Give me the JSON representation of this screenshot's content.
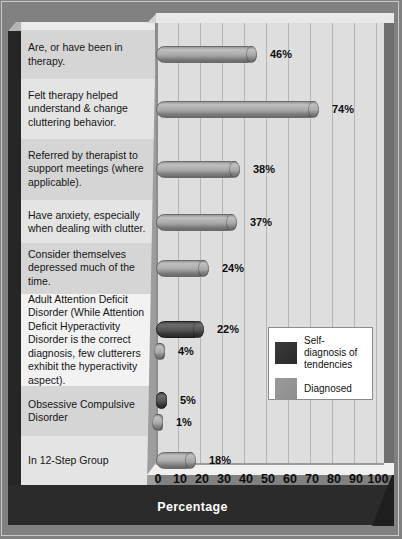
{
  "chart_data": {
    "type": "bar",
    "orientation": "horizontal",
    "title": "",
    "xlabel": "Percentage",
    "ylabel": "",
    "xlim": [
      0,
      100
    ],
    "xticks": [
      0,
      10,
      20,
      30,
      40,
      50,
      60,
      70,
      80,
      90,
      100
    ],
    "xtick_labels": [
      "0",
      "10",
      "20",
      "30",
      "40",
      "50",
      "60",
      "70",
      "80",
      "90",
      "100"
    ],
    "grid": "vertical",
    "legend_position": "center-right",
    "legend": [
      {
        "name": "Self-diagnosis of tendencies",
        "color": "#3b3b3b"
      },
      {
        "name": "Diagnosed",
        "color": "#8e8e8e"
      }
    ],
    "categories": [
      "Are, or have been in therapy.",
      "Felt therapy helped understand & change cluttering behavior.",
      "Referred by therapist to support meetings (where applicable).",
      "Have anxiety, especially when dealing with clutter.",
      "Consider themselves depressed much of the time.",
      "Adult Attention Deficit Disorder (While Attention Deficit Hyperactivity Disorder is the correct diagnosis, few clutterers exhibit the hyperactivity aspect).",
      "Obsessive Compulsive Disorder",
      "In 12-Step Group"
    ],
    "bars": [
      {
        "category_index": 0,
        "series": "Diagnosed",
        "value": 46,
        "label": "46%"
      },
      {
        "category_index": 1,
        "series": "Diagnosed",
        "value": 74,
        "label": "74%"
      },
      {
        "category_index": 2,
        "series": "Diagnosed",
        "value": 38,
        "label": "38%"
      },
      {
        "category_index": 3,
        "series": "Diagnosed",
        "value": 37,
        "label": "37%"
      },
      {
        "category_index": 4,
        "series": "Diagnosed",
        "value": 24,
        "label": "24%"
      },
      {
        "category_index": 5,
        "series": "Self-diagnosis of tendencies",
        "value": 22,
        "label": "22%"
      },
      {
        "category_index": 5,
        "series": "Diagnosed",
        "value": 4,
        "label": "4%"
      },
      {
        "category_index": 6,
        "series": "Self-diagnosis of tendencies",
        "value": 5,
        "label": "5%"
      },
      {
        "category_index": 6,
        "series": "Diagnosed",
        "value": 1,
        "label": "1%"
      },
      {
        "category_index": 7,
        "series": "Diagnosed",
        "value": 18,
        "label": "18%"
      }
    ]
  },
  "labels": {
    "row0": "Are, or have been in therapy.",
    "row1": "Felt therapy helped understand & change cluttering behavior.",
    "row2": "Referred by therapist to support meetings (where applicable).",
    "row3": "Have anxiety, especially when dealing with clutter.",
    "row4": "Consider themselves depressed much of the time.",
    "row5": "Adult Attention Deficit Disorder (While Attention Deficit Hyperactivity Disorder is the correct diagnosis, few clutterers exhibit the hyperactivity aspect).",
    "row6": "Obsessive Compulsive Disorder",
    "row7": "In 12-Step Group"
  },
  "values": {
    "v46": "46%",
    "v74": "74%",
    "v38": "38%",
    "v37": "37%",
    "v24": "24%",
    "v22": "22%",
    "v4": "4%",
    "v5": "5%",
    "v1": "1%",
    "v18": "18%"
  },
  "axis": {
    "title": "Percentage",
    "ticks": [
      "0",
      "10",
      "20",
      "30",
      "40",
      "50",
      "60",
      "70",
      "80",
      "90",
      "100"
    ]
  },
  "legend": {
    "item0": "Self-diagnosis of tendencies",
    "item1": "Diagnosed"
  },
  "colors": {
    "self_diagnosis": "#3b3b3b",
    "diagnosed": "#8e8e8e",
    "plot_background": "#dedede",
    "label_background": "#d6d6d6",
    "frame": "#818181",
    "axis_band": "#2b2b2b"
  }
}
